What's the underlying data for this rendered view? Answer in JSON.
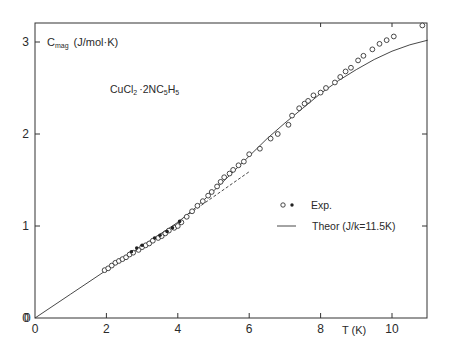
{
  "chart_data": {
    "type": "scatter",
    "title": "",
    "ylabel": "C_mag (J/mol·K)",
    "ylabel_main": "C",
    "ylabel_sub": "mag",
    "ylabel_units": "(J/mol·K)",
    "xlabel": "T (K)",
    "annotation": "CuCl2·2NC5H5",
    "annotation_parts": {
      "a": "CuCl",
      "b": "2",
      "c": "·2NC",
      "d": "5",
      "e": "H",
      "f": "5"
    },
    "xlim": [
      0,
      11
    ],
    "ylim": [
      0,
      3.2
    ],
    "xticks": [
      0,
      2,
      4,
      6,
      8,
      10
    ],
    "xtick_labels": [
      "0",
      "2",
      "4",
      "6",
      "8",
      "10"
    ],
    "yticks": [
      0,
      1,
      2,
      3
    ],
    "ytick_labels": [
      "0",
      "1",
      "2",
      "3"
    ],
    "grid": false,
    "legend": {
      "position": "right-center",
      "entries": [
        {
          "label": "Exp.",
          "marker": "open-circle and filled-dot"
        },
        {
          "label": "Theor (J/k=11.5K)",
          "marker": "solid-line"
        }
      ]
    },
    "series": [
      {
        "name": "Exp. (open)",
        "marker": "open-circle",
        "x": [
          1.95,
          2.05,
          2.15,
          2.25,
          2.35,
          2.45,
          2.55,
          2.65,
          2.75,
          2.9,
          3.0,
          3.1,
          3.2,
          3.3,
          3.45,
          3.55,
          3.65,
          3.75,
          3.9,
          4.0,
          4.1,
          4.25,
          4.4,
          4.55,
          4.7,
          4.85,
          4.95,
          5.1,
          5.2,
          5.3,
          5.45,
          5.55,
          5.7,
          5.85,
          6.0,
          6.3,
          6.6,
          6.8,
          7.1,
          7.2,
          7.4,
          7.55,
          7.65,
          7.8,
          8.0,
          8.15,
          8.4,
          8.55,
          8.7,
          8.85,
          9.05,
          9.2,
          9.45,
          9.65,
          9.85,
          10.05,
          10.85
        ],
        "y": [
          0.52,
          0.54,
          0.57,
          0.6,
          0.62,
          0.64,
          0.66,
          0.69,
          0.71,
          0.74,
          0.77,
          0.79,
          0.81,
          0.84,
          0.87,
          0.89,
          0.92,
          0.95,
          0.98,
          1.0,
          1.04,
          1.1,
          1.16,
          1.22,
          1.27,
          1.33,
          1.37,
          1.43,
          1.48,
          1.53,
          1.57,
          1.61,
          1.66,
          1.7,
          1.78,
          1.84,
          1.95,
          2.0,
          2.1,
          2.2,
          2.28,
          2.33,
          2.36,
          2.42,
          2.45,
          2.5,
          2.56,
          2.62,
          2.68,
          2.72,
          2.8,
          2.85,
          2.92,
          2.98,
          3.02,
          3.06,
          3.18
        ]
      },
      {
        "name": "Exp. (filled)",
        "marker": "filled-dot",
        "x": [
          2.7,
          2.85,
          3.0,
          3.35,
          3.5,
          3.7,
          3.85,
          4.05
        ],
        "y": [
          0.72,
          0.76,
          0.79,
          0.87,
          0.9,
          0.94,
          0.98,
          1.05
        ]
      },
      {
        "name": "Theor (J/k=11.5K)",
        "style": "solid-line",
        "x": [
          0,
          1,
          2,
          3,
          4,
          4.5,
          5,
          5.5,
          6,
          6.5,
          7,
          7.5,
          8,
          8.5,
          9,
          9.5,
          10,
          10.5,
          11
        ],
        "y": [
          0,
          0.26,
          0.52,
          0.78,
          1.04,
          1.2,
          1.38,
          1.57,
          1.76,
          1.95,
          2.12,
          2.28,
          2.44,
          2.58,
          2.7,
          2.81,
          2.9,
          2.97,
          3.02
        ]
      },
      {
        "name": "Linear extrapolation",
        "style": "dashed-line",
        "x": [
          4.2,
          6.0
        ],
        "y": [
          1.1,
          1.59
        ]
      }
    ]
  }
}
